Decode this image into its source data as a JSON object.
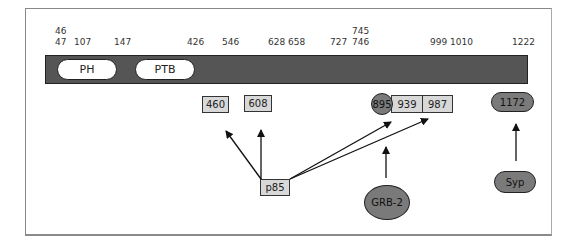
{
  "diagram": {
    "ticks": [
      {
        "label": "46",
        "x": 55,
        "y": 26
      },
      {
        "label": "47",
        "x": 55,
        "y": 37
      },
      {
        "label": "107",
        "x": 74,
        "y": 37
      },
      {
        "label": "147",
        "x": 114,
        "y": 37
      },
      {
        "label": "426",
        "x": 187,
        "y": 37
      },
      {
        "label": "546",
        "x": 222,
        "y": 37
      },
      {
        "label": "628",
        "x": 268,
        "y": 37
      },
      {
        "label": "658",
        "x": 288,
        "y": 37
      },
      {
        "label": "727",
        "x": 330,
        "y": 37
      },
      {
        "label": "745",
        "x": 352,
        "y": 26
      },
      {
        "label": "746",
        "x": 352,
        "y": 37
      },
      {
        "label": "999",
        "x": 430,
        "y": 37
      },
      {
        "label": "1010",
        "x": 450,
        "y": 37
      },
      {
        "label": "1222",
        "x": 512,
        "y": 37
      }
    ],
    "domains": {
      "ph": "PH",
      "ptb": "PTB"
    },
    "phospho_sites": {
      "s460": "460",
      "s608": "608",
      "s895": "895",
      "s939": "939",
      "s987": "987",
      "s1172": "1172"
    },
    "binding_partners": {
      "p85": "p85",
      "grb2": "GRB-2",
      "syp": "Syp"
    },
    "colors": {
      "bar": "#555555",
      "site_fill": "#d8d8d8",
      "partner_fill": "#7a7a7a",
      "domain_fill": "#ffffff"
    }
  }
}
